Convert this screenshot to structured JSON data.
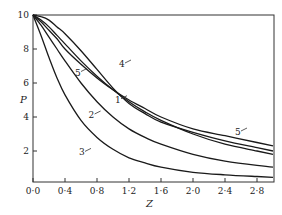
{
  "chart_data": {
    "type": "line",
    "title": "",
    "xlabel": "Z",
    "ylabel": "P",
    "xlim": [
      0.0,
      3.0
    ],
    "ylim": [
      0.2,
      10.0
    ],
    "xticks": [
      "0·0",
      "0·4",
      "0·8",
      "1·2",
      "1·6",
      "2·0",
      "2·4",
      "2·8"
    ],
    "yticks": [
      "2",
      "4",
      "6",
      "8",
      "10"
    ],
    "grid": false,
    "legend": "inline curve labels",
    "x": [
      0.0,
      0.1,
      0.2,
      0.3,
      0.4,
      0.6,
      0.8,
      1.0,
      1.2,
      1.4,
      1.6,
      2.0,
      2.4,
      2.8,
      3.0
    ],
    "series": [
      {
        "name": "1",
        "values": [
          10.0,
          9.7,
          9.3,
          8.8,
          8.3,
          7.3,
          6.4,
          5.6,
          4.9,
          4.3,
          3.8,
          3.0,
          2.4,
          2.0,
          1.8
        ]
      },
      {
        "name": "2",
        "values": [
          10.0,
          9.4,
          8.7,
          8.0,
          7.3,
          6.0,
          4.9,
          4.0,
          3.3,
          2.8,
          2.4,
          1.8,
          1.4,
          1.15,
          1.05
        ]
      },
      {
        "name": "3",
        "values": [
          10.0,
          8.8,
          7.5,
          6.3,
          5.3,
          3.8,
          2.8,
          2.1,
          1.6,
          1.3,
          1.05,
          0.75,
          0.6,
          0.5,
          0.45
        ]
      },
      {
        "name": "4",
        "values": [
          10.0,
          9.9,
          9.7,
          9.3,
          8.9,
          7.9,
          6.8,
          5.7,
          4.8,
          4.2,
          3.7,
          3.1,
          2.6,
          2.2,
          2.0
        ]
      },
      {
        "name": "5",
        "values": [
          10.0,
          9.6,
          9.1,
          8.6,
          8.0,
          7.1,
          6.3,
          5.6,
          5.0,
          4.5,
          4.0,
          3.3,
          2.9,
          2.5,
          2.3
        ]
      }
    ],
    "annotations": [
      {
        "text": "1",
        "x": 1.05,
        "y": 4.9
      },
      {
        "text": "2",
        "x": 0.72,
        "y": 4.0
      },
      {
        "text": "3",
        "x": 0.6,
        "y": 1.8
      },
      {
        "text": "4",
        "x": 1.1,
        "y": 7.0
      },
      {
        "text": "5",
        "x": 0.55,
        "y": 6.5
      },
      {
        "text": "5",
        "x": 2.55,
        "y": 3.0
      }
    ]
  }
}
